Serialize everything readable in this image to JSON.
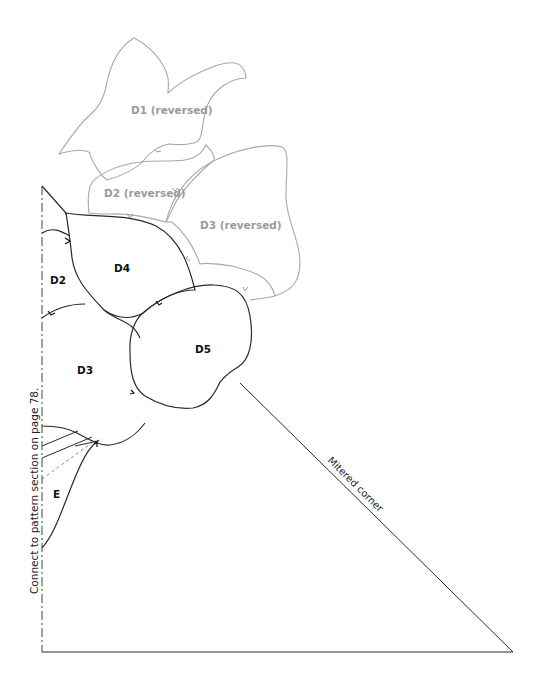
{
  "pieces": {
    "d1_reversed": "D1 (reversed)",
    "d2_reversed": "D2 (reversed)",
    "d3_reversed": "D3 (reversed)",
    "d4": "D4",
    "d2": "D2",
    "d3": "D3",
    "d5": "D5",
    "e": "E"
  },
  "annotations": {
    "connect_note": "Connect to pattern section on page 78.",
    "mitered_corner": "Mitered corner"
  },
  "colors": {
    "reversed_outline": "#a8a8a8",
    "piece_outline": "#2a2a2a",
    "reversed_label": "#9a9a9a",
    "piece_label": "#111111"
  }
}
